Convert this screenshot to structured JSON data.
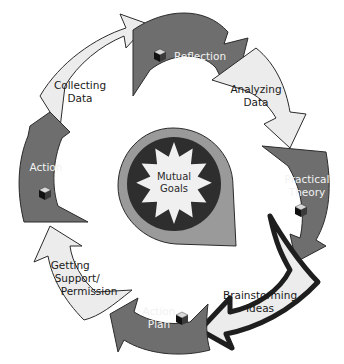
{
  "diagram": {
    "type": "cycle",
    "center": {
      "label_line1": "Mutual",
      "label_line2": "Goals"
    },
    "steps": [
      {
        "id": "reflection",
        "line1": "Reflection",
        "line2": "",
        "style": "dark",
        "has_cube_icon": true
      },
      {
        "id": "analyzing-data",
        "line1": "Analyzing",
        "line2": "Data",
        "style": "light",
        "has_cube_icon": false
      },
      {
        "id": "practical-theory",
        "line1": "Practical",
        "line2": "Theory",
        "style": "dark",
        "has_cube_icon": true
      },
      {
        "id": "brainstorming-ideas",
        "line1": "Brainstorming",
        "line2": "Ideas",
        "style": "light-highlighted",
        "has_cube_icon": false
      },
      {
        "id": "action-plan",
        "line1": "Action",
        "line2": "Plan",
        "style": "dark",
        "has_cube_icon": true
      },
      {
        "id": "getting-support",
        "line1": "Getting",
        "line2": "Support/",
        "line3": "Permission",
        "style": "light",
        "has_cube_icon": false
      },
      {
        "id": "action",
        "line1": "Action",
        "line2": "",
        "style": "dark",
        "has_cube_icon": true
      },
      {
        "id": "collecting-data",
        "line1": "Collecting",
        "line2": "Data",
        "style": "light",
        "has_cube_icon": false
      }
    ],
    "colors": {
      "dark_fill": "#6e6e6e",
      "light_fill": "#ececec",
      "outline": "#2b2b2b",
      "highlight_border": "#1e1e1e",
      "center_outer": "#9a9a9a",
      "center_ring": "#2e2e2e",
      "starburst": "#f0f0f0"
    }
  }
}
